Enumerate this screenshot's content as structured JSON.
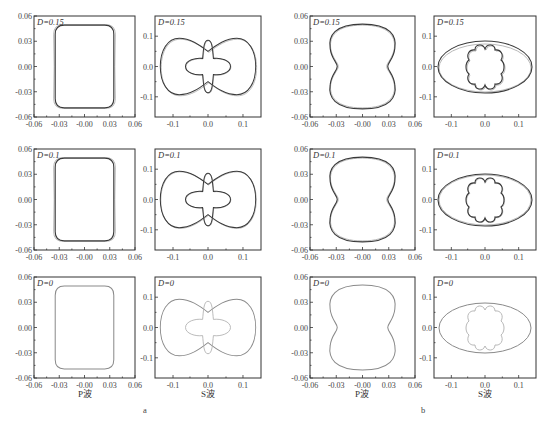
{
  "figure": {
    "sub_labels": {
      "a": "a",
      "b": "b"
    },
    "x_titles": {
      "p": "P波",
      "s": "S波"
    }
  },
  "panels": {
    "a_p_015": {
      "label": "D=0.15"
    },
    "a_s_015": {
      "label": "D=0.15"
    },
    "b_p_015": {
      "label": "D=0.15"
    },
    "b_s_015": {
      "label": "D=0.15"
    },
    "a_p_01": {
      "label": "D=0.1"
    },
    "a_s_01": {
      "label": "D=0.1"
    },
    "b_p_01": {
      "label": "D=0.1"
    },
    "b_s_01": {
      "label": "D=0.1"
    },
    "a_p_0": {
      "label": "D=0"
    },
    "a_s_0": {
      "label": "D=0"
    },
    "b_p_0": {
      "label": "D=0"
    },
    "b_s_0": {
      "label": "D=0"
    }
  },
  "p_ticks": [
    "0.06",
    "0.03",
    "0.00",
    "-0.03",
    "-0.06"
  ],
  "p_xticks": [
    "-0.06",
    "-0.03",
    "-0.00",
    "0.03",
    "0.06"
  ],
  "s_yticks": [
    "0.1",
    "0.0",
    "-0.1"
  ],
  "s_xticks": [
    "-0.1",
    "0.0",
    "0.1"
  ],
  "chart_data": [
    {
      "type": "line",
      "title": "a — P波 wavefront (D=0.15)",
      "xlabel": "",
      "ylabel": "",
      "xlim": [
        -0.06,
        0.06
      ],
      "ylim": [
        -0.06,
        0.06
      ],
      "grid": false,
      "shape": "rounded rectangle, half-width ~0.035, half-height ~0.05, dark vs light curves"
    },
    {
      "type": "line",
      "title": "a — S波 wavefront (D=0.15)",
      "xlim": [
        -0.15,
        0.15
      ],
      "ylim": [
        -0.15,
        0.15
      ],
      "shape": "outer peanut ~±0.13 x, ±0.09 y; inner cross ~±0.07"
    },
    {
      "type": "line",
      "title": "b — P波 wavefront (D=0.15)",
      "xlim": [
        -0.06,
        0.06
      ],
      "ylim": [
        -0.06,
        0.06
      ],
      "shape": "peanut, waist ~0.035 at y=0"
    },
    {
      "type": "line",
      "title": "b — S波 wavefront (D=0.15)",
      "xlim": [
        -0.15,
        0.15
      ],
      "ylim": [
        -0.15,
        0.15
      ],
      "shape": "ellipse ~±0.13 x ±0.07 y; inner four-lobed cusp ~±0.05"
    },
    {
      "type": "line",
      "title": "a — P波 (D=0.1)"
    },
    {
      "type": "line",
      "title": "a — S波 (D=0.1)"
    },
    {
      "type": "line",
      "title": "b — P波 (D=0.1)"
    },
    {
      "type": "line",
      "title": "b — S波 (D=0.1)"
    },
    {
      "type": "line",
      "title": "a — P波 (D=0)"
    },
    {
      "type": "line",
      "title": "a — S波 (D=0)"
    },
    {
      "type": "line",
      "title": "b — P波 (D=0)"
    },
    {
      "type": "line",
      "title": "b — S波 (D=0)"
    }
  ]
}
